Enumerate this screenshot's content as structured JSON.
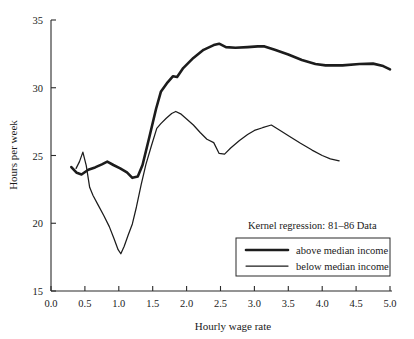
{
  "chart_data": {
    "type": "line",
    "title": "",
    "xlabel": "Hourly wage rate",
    "ylabel": "Hours per week",
    "xlim": [
      0.0,
      5.0
    ],
    "ylim": [
      15,
      35
    ],
    "grid": false,
    "xticks": [
      "0.0",
      "0.5",
      "1.0",
      "1.5",
      "2.0",
      "2.5",
      "3.0",
      "3.5",
      "4.0",
      "4.5",
      "5.0"
    ],
    "xtick_values": [
      0.0,
      0.5,
      1.0,
      1.5,
      2.0,
      2.5,
      3.0,
      3.5,
      4.0,
      4.5,
      5.0
    ],
    "yticks": [
      "15",
      "20",
      "25",
      "30",
      "35"
    ],
    "ytick_values": [
      15,
      20,
      25,
      30,
      35
    ],
    "annotation": "Kernel regression: 81–86 Data",
    "legend_position": "lower-right",
    "series": [
      {
        "name": "above median income",
        "style": "thick",
        "color": "#1c1c1c",
        "points": [
          [
            0.3,
            24.15
          ],
          [
            0.38,
            23.72
          ],
          [
            0.45,
            23.6
          ],
          [
            0.55,
            23.95
          ],
          [
            0.65,
            24.12
          ],
          [
            0.75,
            24.35
          ],
          [
            0.83,
            24.55
          ],
          [
            0.92,
            24.3
          ],
          [
            1.02,
            24.05
          ],
          [
            1.12,
            23.75
          ],
          [
            1.2,
            23.35
          ],
          [
            1.28,
            23.45
          ],
          [
            1.35,
            24.3
          ],
          [
            1.45,
            26.35
          ],
          [
            1.55,
            28.45
          ],
          [
            1.62,
            29.7
          ],
          [
            1.72,
            30.4
          ],
          [
            1.8,
            30.85
          ],
          [
            1.86,
            30.8
          ],
          [
            1.95,
            31.45
          ],
          [
            2.1,
            32.2
          ],
          [
            2.25,
            32.8
          ],
          [
            2.4,
            33.15
          ],
          [
            2.48,
            33.25
          ],
          [
            2.58,
            33.0
          ],
          [
            2.72,
            32.95
          ],
          [
            2.9,
            33.0
          ],
          [
            3.05,
            33.05
          ],
          [
            3.15,
            33.05
          ],
          [
            3.3,
            32.8
          ],
          [
            3.5,
            32.45
          ],
          [
            3.7,
            32.05
          ],
          [
            3.9,
            31.75
          ],
          [
            4.05,
            31.65
          ],
          [
            4.3,
            31.65
          ],
          [
            4.55,
            31.75
          ],
          [
            4.75,
            31.78
          ],
          [
            4.9,
            31.6
          ],
          [
            5.0,
            31.35
          ]
        ]
      },
      {
        "name": "below median income",
        "style": "thin",
        "color": "#1c1c1c",
        "points": [
          [
            0.37,
            24.05
          ],
          [
            0.42,
            24.55
          ],
          [
            0.47,
            25.25
          ],
          [
            0.52,
            24.25
          ],
          [
            0.57,
            22.65
          ],
          [
            0.62,
            22.05
          ],
          [
            0.7,
            21.3
          ],
          [
            0.78,
            20.55
          ],
          [
            0.86,
            19.75
          ],
          [
            0.93,
            18.85
          ],
          [
            0.99,
            18.05
          ],
          [
            1.03,
            17.75
          ],
          [
            1.08,
            18.3
          ],
          [
            1.14,
            19.15
          ],
          [
            1.2,
            19.95
          ],
          [
            1.26,
            21.2
          ],
          [
            1.33,
            22.85
          ],
          [
            1.4,
            24.35
          ],
          [
            1.48,
            25.7
          ],
          [
            1.56,
            27.0
          ],
          [
            1.62,
            27.35
          ],
          [
            1.7,
            27.75
          ],
          [
            1.78,
            28.1
          ],
          [
            1.84,
            28.25
          ],
          [
            1.92,
            28.05
          ],
          [
            2.0,
            27.7
          ],
          [
            2.1,
            27.25
          ],
          [
            2.2,
            26.7
          ],
          [
            2.3,
            26.2
          ],
          [
            2.4,
            25.95
          ],
          [
            2.48,
            25.15
          ],
          [
            2.56,
            25.1
          ],
          [
            2.65,
            25.55
          ],
          [
            2.78,
            26.1
          ],
          [
            2.9,
            26.55
          ],
          [
            3.0,
            26.85
          ],
          [
            3.12,
            27.05
          ],
          [
            3.25,
            27.25
          ],
          [
            3.38,
            26.85
          ],
          [
            3.52,
            26.4
          ],
          [
            3.68,
            25.9
          ],
          [
            3.85,
            25.4
          ],
          [
            4.0,
            25.0
          ],
          [
            4.12,
            24.75
          ],
          [
            4.25,
            24.6
          ]
        ]
      }
    ]
  },
  "legend": {
    "caption": "Kernel regression: 81–86 Data",
    "entries": [
      {
        "label": "above median income"
      },
      {
        "label": "below median income"
      }
    ]
  },
  "axes": {
    "x_title": "Hourly wage rate",
    "y_title": "Hours per week"
  }
}
